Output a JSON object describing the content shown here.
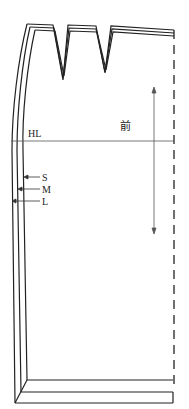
{
  "diagram": {
    "type": "graded-pattern",
    "panel_label": "前",
    "hip_line_label": "HL",
    "size_labels": [
      "S",
      "M",
      "L"
    ],
    "grainline": "vertical double-headed arrow",
    "center_front": "dashed fold line",
    "darts": 2,
    "colors": {
      "line": "#222222",
      "thin_line": "#555555",
      "background": "#ffffff"
    }
  }
}
